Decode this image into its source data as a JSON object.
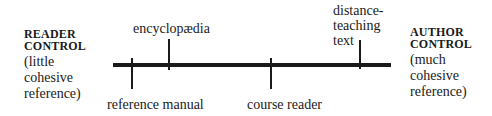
{
  "diagram": {
    "left_pole": {
      "title_line1": "READER",
      "title_line2": "CONTROL",
      "sub_line1": "(little",
      "sub_line2": "cohesive",
      "sub_line3": "reference)"
    },
    "right_pole": {
      "title_line1": "AUTHOR",
      "title_line2": "CONTROL",
      "sub_line1": "(much",
      "sub_line2": "cohesive",
      "sub_line3": "reference)"
    },
    "points": [
      {
        "label": "reference manual",
        "position": "below"
      },
      {
        "label": "encyclopædia",
        "position": "above"
      },
      {
        "label": "course reader",
        "position": "below"
      },
      {
        "label_line1": "distance-",
        "label_line2": "teaching",
        "label_line3": "text",
        "position": "above"
      }
    ],
    "colors": {
      "line": "#1a1a1a",
      "background": "#ffffff"
    }
  }
}
